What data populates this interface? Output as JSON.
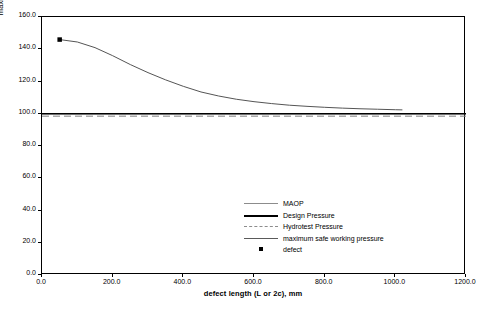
{
  "chart_data": {
    "type": "line",
    "title": "",
    "xlabel": "defect length (L or 2c), mm",
    "ylabel": "maximum safe working pressure, bar",
    "xlim": [
      0,
      1200
    ],
    "ylim": [
      0,
      160
    ],
    "xticks": [
      "0.0",
      "200.0",
      "400.0",
      "600.0",
      "800.0",
      "1000.0",
      "1200.0"
    ],
    "yticks": [
      "0.0",
      "20.0",
      "40.0",
      "60.0",
      "80.0",
      "100.0",
      "120.0",
      "140.0",
      "160.0"
    ],
    "grid": false,
    "legend_position": "inside-lower-right",
    "series": [
      {
        "name": "MAOP",
        "style": "solid-thin",
        "color": "#808080",
        "type": "horizontal-line",
        "value": 100
      },
      {
        "name": "Design Pressure",
        "style": "solid-thick",
        "color": "#000000",
        "type": "horizontal-line",
        "value": 100
      },
      {
        "name": "Hydrotest Pressure",
        "style": "dashed",
        "color": "#808080",
        "type": "horizontal-line",
        "value": 98.5
      },
      {
        "name": "maximum safe working pressure",
        "style": "solid",
        "color": "#555555",
        "type": "curve",
        "x": [
          50,
          100,
          150,
          200,
          250,
          300,
          350,
          400,
          450,
          500,
          550,
          600,
          650,
          700,
          750,
          800,
          850,
          900,
          950,
          1000,
          1020
        ],
        "y": [
          146,
          144.5,
          141,
          136,
          130.5,
          125.5,
          121,
          117,
          113.5,
          111,
          109,
          107.5,
          106.3,
          105.3,
          104.6,
          104,
          103.5,
          103.1,
          102.8,
          102.5,
          102.4
        ]
      },
      {
        "name": "defect",
        "style": "square-marker",
        "color": "#000000",
        "type": "scatter",
        "points": [
          {
            "x": 50,
            "y": 146
          }
        ]
      }
    ]
  },
  "legend": {
    "items": [
      {
        "label": "MAOP"
      },
      {
        "label": "Design Pressure"
      },
      {
        "label": "Hydrotest Pressure"
      },
      {
        "label": "maximum safe working pressure"
      },
      {
        "label": "defect"
      }
    ]
  }
}
